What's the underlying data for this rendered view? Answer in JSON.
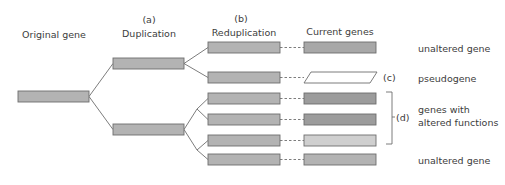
{
  "columns": {
    "original": {
      "label": "Original gene"
    },
    "duplication": {
      "marker": "(a)",
      "label": "Duplication"
    },
    "reduplication": {
      "marker": "(b)",
      "label": "Reduplication"
    },
    "current": {
      "label": "Current genes"
    }
  },
  "outcomes": {
    "unaltered_top": "unaltered gene",
    "pseudogene": "pseudogene",
    "pseudogene_marker": "(c)",
    "altered_line1": "genes with",
    "altered_line2": "altered functions",
    "altered_marker": "(d)",
    "unaltered_bottom": "unaltered gene"
  },
  "colors": {
    "gene_fill": "#b3b3b3",
    "gene_stroke": "#6e6e6e",
    "current_dark": "#9c9c9c",
    "current_light": "#cfcfcf",
    "line": "#6e6e6e"
  }
}
